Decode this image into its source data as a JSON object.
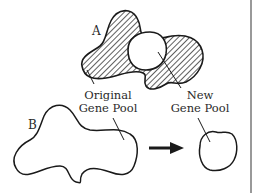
{
  "diagram": {
    "type": "founder-effect",
    "labels": {
      "a": "A",
      "b": "B",
      "original_line1": "Original",
      "original_line2": "Gene Pool",
      "new_line1": "New",
      "new_line2": "Gene Pool"
    },
    "colors": {
      "stroke": "#1a1a1a",
      "hatch": "#1a1a1a",
      "background": "#ffffff",
      "border": "#555555"
    },
    "arrow": {
      "direction": "right"
    }
  }
}
